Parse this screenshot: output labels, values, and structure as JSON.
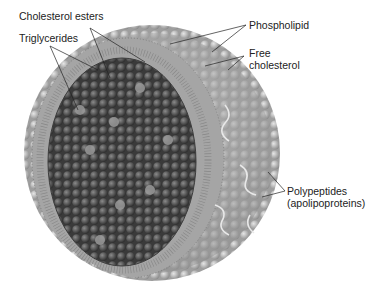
{
  "figure": {
    "labels": {
      "cholesterol_esters": "Cholesterol esters",
      "triglycerides": "Triglycerides",
      "phospholipid": "Phospholipid",
      "free_cholesterol_line1": "Free",
      "free_cholesterol_line2": "cholesterol",
      "polypeptides_line1": "Polypeptides",
      "polypeptides_line2": "(apolipoproteins)"
    },
    "colors": {
      "background": "#ffffff",
      "core": "#4a4a4a",
      "shell": "#a8a8a8",
      "text": "#222222"
    }
  }
}
